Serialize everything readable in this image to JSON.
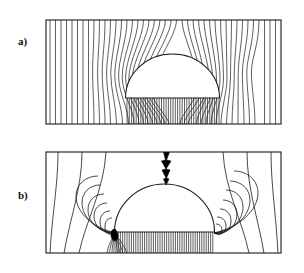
{
  "figure": {
    "type": "diagram",
    "background_color": "#ffffff",
    "line_color": "#1a1a1a",
    "fill_color": "#ffffff",
    "panels": [
      {
        "id": "a",
        "label": "a)",
        "caption_position": "left",
        "frame": {
          "x": 46,
          "y": 20,
          "width": 235,
          "height": 104
        },
        "dome": {
          "cx": 172.5,
          "cy": 98,
          "rx": 47,
          "ry": 44,
          "base_y": 98
        },
        "field_description": "uniform vertical field lines deflected around the dome",
        "field_line_count": 38,
        "dense_base_line_count": 40,
        "has_lightning": false
      },
      {
        "id": "b",
        "label": "b)",
        "caption_position": "left",
        "frame": {
          "x": 46,
          "y": 152,
          "width": 235,
          "height": 101
        },
        "dome": {
          "cx": 164.5,
          "cy": 232,
          "rx": 50,
          "ry": 48,
          "base_y": 232
        },
        "field_description": "field lines converging into nested arcs at the dome base corners during a strike",
        "field_line_count": 8,
        "arc_count_per_side": 7,
        "dense_base_line_count": 46,
        "has_lightning": true,
        "lightning": {
          "label": "lightning-bolt",
          "color": "#000000",
          "from_y": 152,
          "to_y": 184,
          "x": 166
        },
        "attachment_point": {
          "label": "strike-attachment-point",
          "x": 115,
          "y": 233,
          "color": "#000000"
        }
      }
    ]
  }
}
